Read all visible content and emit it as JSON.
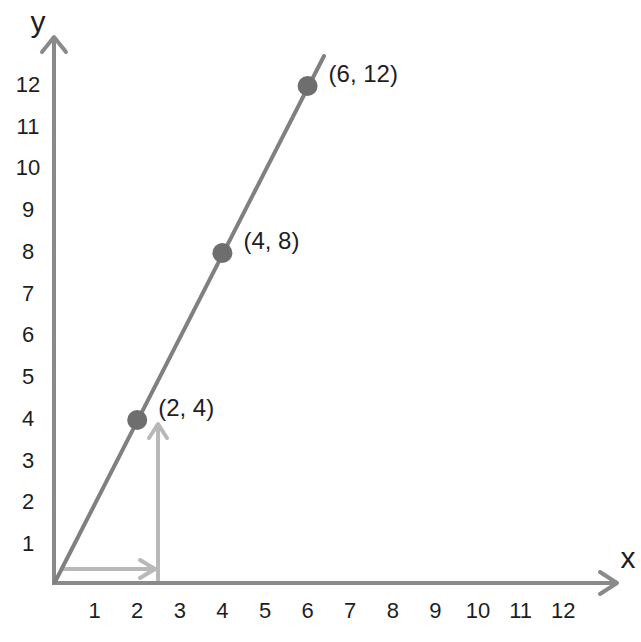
{
  "chart_data": {
    "type": "line",
    "title": "",
    "xlabel": "x",
    "ylabel": "y",
    "xlim": [
      0,
      12
    ],
    "ylim": [
      0,
      12
    ],
    "grid": false,
    "x_ticks": [
      "1",
      "2",
      "3",
      "4",
      "5",
      "6",
      "7",
      "8",
      "9",
      "10",
      "11",
      "12"
    ],
    "y_ticks": [
      "1",
      "2",
      "3",
      "4",
      "5",
      "6",
      "7",
      "8",
      "9",
      "10",
      "11",
      "12"
    ],
    "series": [
      {
        "name": "y = 2x",
        "x": [
          0,
          2,
          4,
          6
        ],
        "y": [
          0,
          4,
          8,
          12
        ],
        "color": "#808080"
      }
    ],
    "points": [
      {
        "x": 2,
        "y": 4,
        "label": "(2, 4)"
      },
      {
        "x": 4,
        "y": 8,
        "label": "(4, 8)"
      },
      {
        "x": 6,
        "y": 12,
        "label": "(6, 12)"
      }
    ],
    "annotations": [
      {
        "type": "arrow",
        "description": "horizontal arrow along x from 0 to ~2.4",
        "color": "#b5b5b5"
      },
      {
        "type": "arrow",
        "description": "vertical arrow at x ~2.4 from 0 up to y=4",
        "color": "#b5b5b5"
      }
    ]
  },
  "colors": {
    "axis": "#8a8a8a",
    "line": "#808080",
    "point": "#6e6e6e",
    "helper_arrow": "#b8b8b8",
    "text": "#1e1e1e"
  }
}
